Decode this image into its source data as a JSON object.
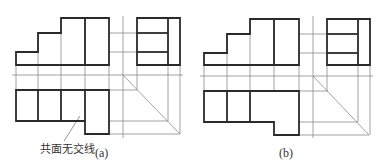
{
  "figure": {
    "panels": [
      {
        "id": "a",
        "caption": "(a)",
        "annotation": "共面无交线",
        "front_view": {
          "outline": [
            [
              61,
              18
            ],
            [
              109,
              18
            ],
            [
              109,
              65
            ],
            [
              16,
              65
            ],
            [
              16,
              52
            ],
            [
              38,
              52
            ],
            [
              38,
              33
            ],
            [
              61,
              33
            ]
          ],
          "inner_lines": [
            [
              [
                85,
                18
              ],
              [
                85,
                65
              ]
            ]
          ]
        },
        "side_view": {
          "outline": [
            [
              137,
              18
            ],
            [
              180,
              18
            ],
            [
              180,
              65
            ],
            [
              137,
              65
            ]
          ],
          "inner_lines": [
            [
              [
                168,
                18
              ],
              [
                168,
                65
              ]
            ],
            [
              [
                137,
                33
              ],
              [
                168,
                33
              ]
            ],
            [
              [
                137,
                52
              ],
              [
                168,
                52
              ]
            ]
          ]
        },
        "top_view": {
          "outline": [
            [
              16,
              90
            ],
            [
              109,
              90
            ],
            [
              109,
              134
            ],
            [
              85,
              134
            ],
            [
              85,
              121
            ],
            [
              16,
              121
            ]
          ],
          "inner_lines": [
            [
              [
                38,
                90
              ],
              [
                38,
                121
              ]
            ],
            [
              [
                61,
                90
              ],
              [
                61,
                121
              ]
            ],
            [
              [
                85,
                90
              ],
              [
                85,
                121
              ]
            ]
          ]
        },
        "construction": {
          "h_axis": [
            [
              12,
              75
            ],
            [
              183,
              75
            ]
          ],
          "v_axis": [
            [
              123,
              16
            ],
            [
              123,
              138
            ]
          ],
          "miter": [
            [
              123,
              75
            ],
            [
              180,
              134
            ]
          ],
          "h_lines": [
            [
              [
                109,
                33
              ],
              [
                137,
                33
              ]
            ],
            [
              [
                109,
                52
              ],
              [
                137,
                52
              ]
            ],
            [
              [
                109,
                90
              ],
              [
                137,
                90
              ]
            ],
            [
              [
                109,
                121
              ],
              [
                168,
                121
              ]
            ],
            [
              [
                109,
                134
              ],
              [
                180,
                134
              ]
            ]
          ],
          "v_lines": [
            [
              [
                16,
                65
              ],
              [
                16,
                90
              ]
            ],
            [
              [
                38,
                33
              ],
              [
                38,
                90
              ]
            ],
            [
              [
                61,
                18
              ],
              [
                61,
                90
              ]
            ],
            [
              [
                85,
                18
              ],
              [
                85,
                90
              ]
            ],
            [
              [
                109,
                65
              ],
              [
                109,
                90
              ]
            ],
            [
              [
                137,
                65
              ],
              [
                137,
                90
              ]
            ],
            [
              [
                168,
                65
              ],
              [
                168,
                121
              ]
            ],
            [
              [
                180,
                65
              ],
              [
                180,
                134
              ]
            ]
          ],
          "leader": [
            [
              64,
              141
            ],
            [
              80,
              116
            ]
          ]
        }
      },
      {
        "id": "b",
        "caption": "(b)",
        "front_view": {
          "outline": [
            [
              250,
              19
            ],
            [
              299,
              19
            ],
            [
              299,
              65
            ],
            [
              204,
              65
            ],
            [
              204,
              53
            ],
            [
              227,
              53
            ],
            [
              227,
              34
            ],
            [
              250,
              34
            ]
          ],
          "inner_lines": [
            [
              [
                274,
                19
              ],
              [
                274,
                65
              ]
            ]
          ]
        },
        "side_view": {
          "outline": [
            [
              327,
              19
            ],
            [
              370,
              19
            ],
            [
              370,
              65
            ],
            [
              327,
              65
            ]
          ],
          "inner_lines": [
            [
              [
                358,
                19
              ],
              [
                358,
                65
              ]
            ],
            [
              [
                327,
                34
              ],
              [
                358,
                34
              ]
            ],
            [
              [
                327,
                53
              ],
              [
                358,
                53
              ]
            ]
          ]
        },
        "top_view": {
          "outline": [
            [
              204,
              91
            ],
            [
              299,
              91
            ],
            [
              299,
              135
            ],
            [
              274,
              135
            ],
            [
              274,
              122
            ],
            [
              204,
              122
            ]
          ],
          "inner_lines": [
            [
              [
                227,
                91
              ],
              [
                227,
                122
              ]
            ],
            [
              [
                250,
                91
              ],
              [
                250,
                122
              ]
            ]
          ]
        },
        "construction": {
          "h_axis": [
            [
              200,
              76
            ],
            [
              373,
              76
            ]
          ],
          "v_axis": [
            [
              313,
              16
            ],
            [
              313,
              138
            ]
          ],
          "miter": [
            [
              313,
              76
            ],
            [
              369,
              135
            ]
          ],
          "h_lines": [
            [
              [
                299,
                34
              ],
              [
                327,
                34
              ]
            ],
            [
              [
                299,
                53
              ],
              [
                327,
                53
              ]
            ],
            [
              [
                299,
                91
              ],
              [
                328,
                91
              ]
            ],
            [
              [
                299,
                122
              ],
              [
                358,
                122
              ]
            ],
            [
              [
                299,
                135
              ],
              [
                369,
                135
              ]
            ]
          ],
          "v_lines": [
            [
              [
                204,
                65
              ],
              [
                204,
                91
              ]
            ],
            [
              [
                227,
                34
              ],
              [
                227,
                91
              ]
            ],
            [
              [
                250,
                19
              ],
              [
                250,
                91
              ]
            ],
            [
              [
                274,
                19
              ],
              [
                274,
                91
              ]
            ],
            [
              [
                299,
                65
              ],
              [
                299,
                91
              ]
            ],
            [
              [
                327,
                65
              ],
              [
                327,
                91
              ]
            ],
            [
              [
                358,
                65
              ],
              [
                358,
                122
              ]
            ],
            [
              [
                370,
                65
              ],
              [
                370,
                135
              ]
            ]
          ]
        }
      }
    ]
  }
}
